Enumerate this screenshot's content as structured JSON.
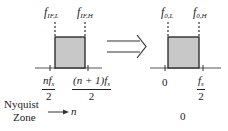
{
  "diagram": {
    "colors": {
      "band_fill": "#c8c8c8",
      "band_stroke": "#222222",
      "axis": "#555555"
    },
    "left_panel": {
      "marker_low": {
        "base": "f",
        "sub": "IF,L"
      },
      "marker_high": {
        "base": "f",
        "sub": "IF,H"
      },
      "tick_left": {
        "num": "nf",
        "num_sub": "s",
        "den": "2"
      },
      "tick_right": {
        "num": "(n + 1)f",
        "num_sub": "s",
        "den": "2"
      }
    },
    "arrow": {
      "type": "double-line-right-arrow"
    },
    "right_panel": {
      "marker_low": {
        "base": "f",
        "sub": "0,L"
      },
      "marker_high": {
        "base": "f",
        "sub": "0,H"
      },
      "tick_left": {
        "label": "0"
      },
      "tick_right": {
        "num": "f",
        "num_sub": "s",
        "den": "2"
      }
    },
    "zone_legend": {
      "line1": "Nyquist",
      "line2": "Zone",
      "variable": "n"
    },
    "right_zone_value": "0"
  }
}
